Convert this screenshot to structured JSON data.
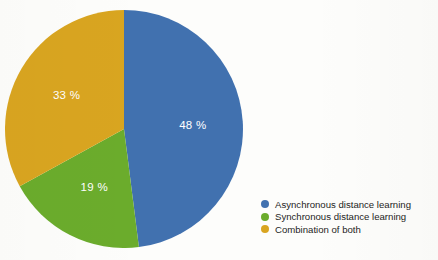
{
  "chart_data": {
    "type": "pie",
    "title": "",
    "subtitle": "",
    "xlabel": "",
    "ylabel": "",
    "grid": false,
    "legend_position": "bottom-right",
    "start_angle_deg": 0,
    "direction": "clockwise",
    "categories": [
      "Asynchronous distance learning",
      "Synchronous distance learning",
      "Combination of both"
    ],
    "values": [
      48,
      19,
      33
    ],
    "value_unit": "%",
    "data_labels": [
      "48 %",
      "19 %",
      "33 %"
    ],
    "colors": [
      "#4171AF",
      "#6BAC2C",
      "#D9A520"
    ],
    "slices": [
      {
        "label": "Asynchronous distance learning",
        "value": 48,
        "data_label": "48 %",
        "color": "#4171AF"
      },
      {
        "label": "Synchronous distance learning",
        "value": 19,
        "data_label": "19 %",
        "color": "#6BAC2C"
      },
      {
        "label": "Combination of both",
        "value": 33,
        "data_label": "33 %",
        "color": "#D9A520"
      }
    ]
  },
  "legend": {
    "items": [
      {
        "label": "Asynchronous distance learning",
        "color": "#4171AF"
      },
      {
        "label": "Synchronous distance learning",
        "color": "#6BAC2C"
      },
      {
        "label": "Combination of both",
        "color": "#D9A520"
      }
    ]
  },
  "labels": {
    "slice_1": "48 %",
    "slice_2": "19 %",
    "slice_3": "33 %"
  },
  "theme": {
    "background": "#fdfdfb",
    "label_text": "#ffffff",
    "legend_text": "#1d1d1d"
  }
}
